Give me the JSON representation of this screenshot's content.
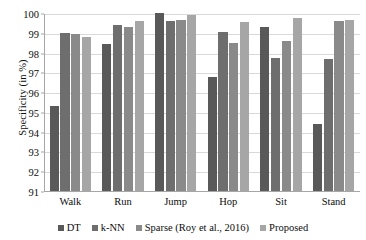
{
  "chart_data": {
    "type": "bar",
    "title": "",
    "xlabel": "",
    "ylabel": "Specificity (in %)",
    "ylim": [
      91,
      100
    ],
    "yticks": [
      91,
      92,
      93,
      94,
      95,
      96,
      97,
      98,
      99,
      100
    ],
    "ytick_labels": [
      "91",
      "92",
      "93",
      "94",
      "95",
      "96",
      "97",
      "98",
      "99",
      "100"
    ],
    "grid": true,
    "legend_position": "bottom",
    "categories": [
      "Walk",
      "Run",
      "Jump",
      "Hop",
      "Sit",
      "Stand"
    ],
    "series": [
      {
        "name": "DT",
        "color": "#595959",
        "values": [
          95.3,
          98.45,
          100.0,
          96.75,
          99.3,
          94.4
        ]
      },
      {
        "name": "k-NN",
        "color": "#6e6e6e",
        "values": [
          99.0,
          99.4,
          99.6,
          99.05,
          97.75,
          97.7
        ]
      },
      {
        "name": "Sparse (Roy et al., 2016)",
        "color": "#8a8a8a",
        "values": [
          98.95,
          99.3,
          99.65,
          98.5,
          98.6,
          99.6
        ]
      },
      {
        "name": "Proposed",
        "color": "#a6a6a6",
        "values": [
          98.8,
          99.6,
          99.9,
          99.55,
          99.75,
          99.65
        ]
      }
    ]
  },
  "axis": {
    "y_title": "Specificity (in %)"
  }
}
